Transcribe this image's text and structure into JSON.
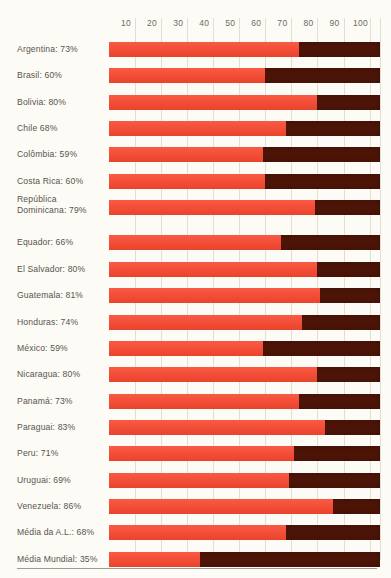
{
  "chart_data": {
    "type": "bar",
    "title": "",
    "subtitle": "",
    "xlabel": "",
    "ylabel": "",
    "orientation": "horizontal",
    "stacked": true,
    "grid": true,
    "legend_position": "none",
    "xlim": [
      0,
      104
    ],
    "xticks": [
      10,
      20,
      30,
      40,
      50,
      60,
      70,
      80,
      90,
      100
    ],
    "xtick_labels": [
      "10",
      "20",
      "30",
      "40",
      "50",
      "60",
      "70",
      "80",
      "90",
      "100"
    ],
    "categories": [
      "Argentina",
      "Brasil",
      "Bolivia",
      "Chile",
      "Colômbia",
      "Costa Rica",
      "República Dominicana",
      "Equador",
      "El Salvador",
      "Guatemala",
      "Honduras",
      "México",
      "Nicaragua",
      "Panamá",
      "Paraguai",
      "Peru",
      "Uruguai",
      "Venezuela",
      "Média da A.L.",
      "Média Mundial"
    ],
    "values": [
      73,
      60,
      80,
      68,
      59,
      60,
      79,
      66,
      80,
      81,
      74,
      59,
      80,
      73,
      83,
      71,
      69,
      86,
      68,
      35
    ],
    "series": [
      {
        "name": "value",
        "color": "#f9472f",
        "values": [
          73,
          60,
          80,
          68,
          59,
          60,
          79,
          66,
          80,
          81,
          74,
          59,
          80,
          73,
          83,
          71,
          69,
          86,
          68,
          35
        ]
      },
      {
        "name": "remainder",
        "color": "#4d1507",
        "values": [
          31,
          44,
          24,
          36,
          45,
          44,
          25,
          38,
          24,
          23,
          30,
          45,
          24,
          31,
          21,
          33,
          35,
          18,
          36,
          69
        ]
      }
    ],
    "colors": {
      "value": "#f9472f",
      "remainder": "#4d1507",
      "background": "#fdfbf6",
      "gridline": "#e2ded2",
      "text": "#58544e",
      "rule": "#9c9a95"
    }
  },
  "rows": [
    {
      "label": "Argentina: 73%",
      "value": 73
    },
    {
      "label": "Brasil: 60%",
      "value": 60
    },
    {
      "label": "Bolivia: 80%",
      "value": 80
    },
    {
      "label": "Chile 68%",
      "value": 68
    },
    {
      "label": "Colômbia: 59%",
      "value": 59
    },
    {
      "label": "Costa Rica: 60%",
      "value": 60
    },
    {
      "label": "República\nDominicana: 79%",
      "value": 79
    },
    {
      "label": "Equador: 66%",
      "value": 66
    },
    {
      "label": "El Salvador: 80%",
      "value": 80
    },
    {
      "label": "Guatemala: 81%",
      "value": 81
    },
    {
      "label": "Honduras: 74%",
      "value": 74
    },
    {
      "label": "México: 59%",
      "value": 59
    },
    {
      "label": "Nicaragua: 80%",
      "value": 80
    },
    {
      "label": "Panamá: 73%",
      "value": 73
    },
    {
      "label": "Paraguai: 83%",
      "value": 83
    },
    {
      "label": "Peru: 71%",
      "value": 71
    },
    {
      "label": "Uruguai: 69%",
      "value": 69
    },
    {
      "label": "Venezuela: 86%",
      "value": 86
    },
    {
      "label": "Média da A.L.: 68%",
      "value": 68
    },
    {
      "label": "Média Mundial: 35%",
      "value": 35
    }
  ],
  "axis": {
    "ticks": [
      "10",
      "20",
      "30",
      "40",
      "50",
      "60",
      "70",
      "80",
      "90",
      "100"
    ]
  }
}
